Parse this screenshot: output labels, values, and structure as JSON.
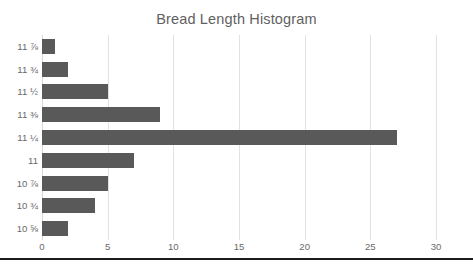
{
  "chart_data": {
    "type": "bar",
    "orientation": "horizontal",
    "title": "Bread Length Histogram",
    "xlabel": "",
    "ylabel": "",
    "categories": [
      "11 ⅞",
      "11 ¾",
      "11 ½",
      "11 ⅜",
      "11 ¼",
      "11",
      "10 ⅞",
      "10 ¾",
      "10 ⅝"
    ],
    "values": [
      1,
      2,
      5,
      9,
      27,
      7,
      5,
      4,
      2
    ],
    "xlim": [
      0,
      30
    ],
    "xticks": [
      0,
      5,
      10,
      15,
      20,
      25,
      30
    ],
    "xtick_labels": [
      "0",
      "5",
      "10",
      "15",
      "20",
      "25",
      "30"
    ],
    "grid": "vertical",
    "legend": "none",
    "bar_color": "#595959",
    "gridline_color": "#e2e2e2",
    "title_color": "#5f5f5f",
    "tick_label_color": "#6a6a6a"
  }
}
